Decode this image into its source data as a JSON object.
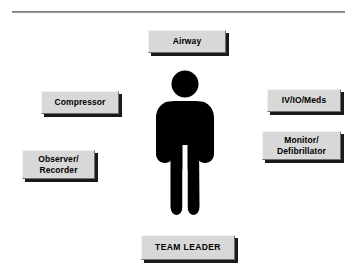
{
  "diagram": {
    "background_color": "#ffffff",
    "box_fill_color": "#d8d8d8",
    "box_shadow_color": "#1a1a1a",
    "figure_color": "#000000",
    "rule": {
      "name": "top-horizontal-rule",
      "color": "#6e6e6e"
    },
    "center_figure": {
      "icon": "person-figure-icon",
      "label": ""
    },
    "boxes": {
      "airway": {
        "label": "Airway"
      },
      "compressor": {
        "label": "Compressor"
      },
      "observer_recorder": {
        "line1": "Observer/",
        "line2": "Recorder"
      },
      "iv_io_meds": {
        "label": "IV/IO/Meds"
      },
      "monitor_defibrillator": {
        "line1": "Monitor/",
        "line2": "Defibrillator"
      },
      "team_leader": {
        "label": "TEAM LEADER"
      }
    }
  }
}
